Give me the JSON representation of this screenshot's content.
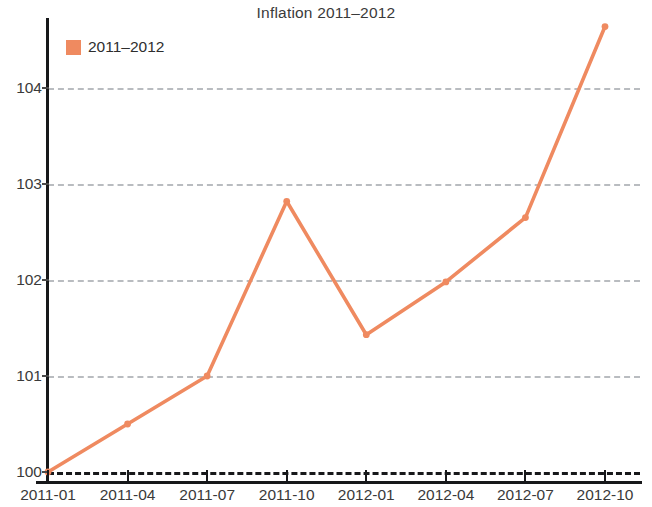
{
  "chart_data": {
    "type": "line",
    "title": "Inflation 2011–2012",
    "xlabel": "",
    "ylabel": "",
    "grid": true,
    "legend_position": "top-left",
    "x": [
      "2011-01",
      "2011-04",
      "2011-07",
      "2011-10",
      "2012-01",
      "2012-04",
      "2012-07",
      "2012-10"
    ],
    "xtick_labels": [
      "2011-01",
      "2011-04",
      "2011-07",
      "2011-10",
      "2012-01",
      "2012-04",
      "2012-07",
      "2012-10"
    ],
    "ytick_labels": [
      "100",
      "101",
      "102",
      "103",
      "104"
    ],
    "yticks": [
      100,
      101,
      102,
      103,
      104
    ],
    "ylim": [
      100,
      104.75
    ],
    "series": [
      {
        "name": "2011–2012",
        "color": "#ef8a60",
        "marker": "circle",
        "values": [
          100.0,
          100.5,
          101.0,
          102.82,
          101.43,
          101.98,
          102.65,
          104.64
        ]
      }
    ],
    "baseline": {
      "value": 100,
      "style": "dashed",
      "color": "#17181a"
    },
    "gridline_color": "#b9bcc0",
    "axis_color": "#17181a"
  },
  "legend": {
    "entries": [
      {
        "label": "2011–2012",
        "color": "#ef8a60"
      }
    ]
  }
}
